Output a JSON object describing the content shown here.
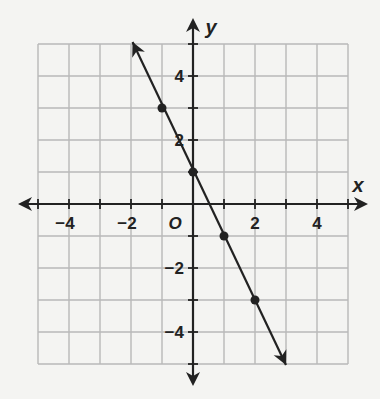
{
  "chart_data": {
    "type": "line",
    "title": "",
    "xlabel": "x",
    "ylabel": "y",
    "origin_label": "O",
    "xlim": [
      -5,
      5
    ],
    "ylim": [
      -5,
      5
    ],
    "grid": true,
    "x_ticks": [
      -4,
      -2,
      2,
      4
    ],
    "y_ticks": [
      4,
      2,
      -2,
      -4
    ],
    "x_tick_labels": [
      "−4",
      "−2",
      "2",
      "4"
    ],
    "y_tick_labels": [
      "4",
      "2",
      "−2",
      "−4"
    ],
    "series": [
      {
        "name": "line",
        "equation": "y = -2x + 1",
        "points": [
          [
            -1,
            3
          ],
          [
            0,
            1
          ],
          [
            1,
            -1
          ],
          [
            2,
            -3
          ]
        ],
        "arrow_start": [
          -1.95,
          5.0
        ],
        "arrow_end": [
          3.0,
          -5.0
        ]
      }
    ],
    "colors": {
      "grid": "#b8b8b8",
      "axis": "#222222",
      "line": "#222222",
      "background": "#f4f4f2"
    }
  }
}
